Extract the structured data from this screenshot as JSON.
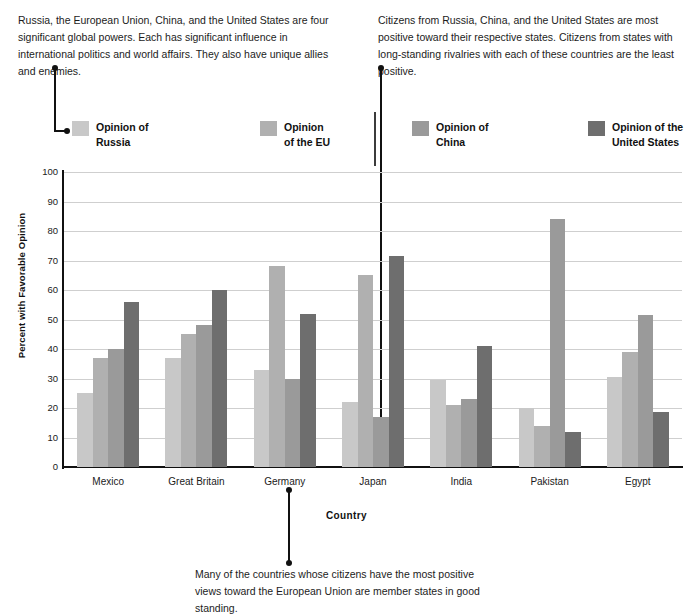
{
  "annotations": [
    {
      "id": "top-left",
      "text": "Russia, the European Union, China, and the United States are four significant global powers. Each has significant influence in international politics and world affairs. They also have unique allies and enemies."
    },
    {
      "id": "top-right",
      "text": "Citizens from Russia, China, and the United States are most positive toward their respective states. Citizens from states with long-standing rivalries with each of these countries are the least positive."
    },
    {
      "id": "bottom",
      "text": "Many of the countries whose citizens have the most positive views toward the European Union are member states in good standing."
    }
  ],
  "legend": {
    "items": [
      {
        "label": "Opinion of\nRussia",
        "color": "#c8c8c8"
      },
      {
        "label": "Opinion\nof the EU",
        "color": "#b0b0b0"
      },
      {
        "label": "Opinion of\nChina",
        "color": "#9a9a9a"
      },
      {
        "label": "Opinion of the\nUnited States",
        "color": "#6e6e6e"
      }
    ]
  },
  "chart_data": {
    "type": "bar",
    "title": "",
    "xlabel": "Country",
    "ylabel": "Percent with Favorable Opinion",
    "ylim": [
      0,
      100
    ],
    "yticks": [
      0,
      10,
      20,
      30,
      40,
      50,
      60,
      70,
      80,
      90,
      100
    ],
    "grid": true,
    "legend_position": "top",
    "categories": [
      "Mexico",
      "Great Britain",
      "Germany",
      "Japan",
      "India",
      "Pakistan",
      "Egypt"
    ],
    "series": [
      {
        "name": "Opinion of Russia",
        "color": "#c8c8c8",
        "values": [
          25,
          37,
          33,
          22,
          29.5,
          20,
          30.5
        ]
      },
      {
        "name": "Opinion of the EU",
        "color": "#b0b0b0",
        "values": [
          37,
          45,
          68,
          65,
          21,
          14,
          39
        ]
      },
      {
        "name": "Opinion of China",
        "color": "#9a9a9a",
        "values": [
          40,
          48,
          30,
          17,
          23,
          84,
          51.5
        ]
      },
      {
        "name": "Opinion of the United States",
        "color": "#6e6e6e",
        "values": [
          56,
          60,
          52,
          71.5,
          41,
          12,
          18.5
        ]
      }
    ]
  }
}
